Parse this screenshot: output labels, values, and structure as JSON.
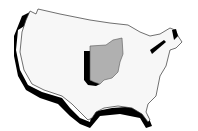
{
  "map": {
    "subject": "United States outline",
    "highlighted_state": "Ohio",
    "colors": {
      "background": "#ffffff",
      "land": "#f7f7f7",
      "outline": "#333333",
      "shadow": "#000000",
      "highlight": "#b0b0b0"
    }
  }
}
